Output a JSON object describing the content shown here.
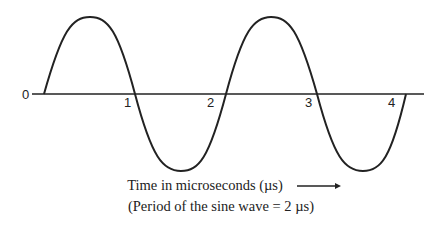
{
  "diagram": {
    "type": "sine-wave",
    "tick_labels": [
      "0",
      "1",
      "2",
      "3",
      "4"
    ],
    "caption_line1": "Time in microseconds (µs)",
    "caption_line2": "(Period of the sine wave =  2 µs)",
    "axis_arrow": "right-arrow",
    "period_us": 2,
    "cycles_shown": 2,
    "line_color": "#222222"
  }
}
